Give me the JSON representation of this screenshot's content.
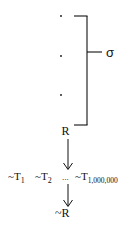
{
  "diagram": {
    "dots": [
      ".",
      ".",
      "."
    ],
    "bracket_label": "σ",
    "premise": "R",
    "negations": [
      {
        "prefix": "~T",
        "subscript": "1"
      },
      {
        "prefix": "~T",
        "subscript": "2"
      },
      {
        "prefix": "",
        "subscript": "",
        "text": "..."
      },
      {
        "prefix": "~T",
        "subscript": "1,000,000"
      }
    ],
    "conclusion": "~R",
    "colors": {
      "ink": "#111111",
      "background": "#ffffff"
    }
  }
}
